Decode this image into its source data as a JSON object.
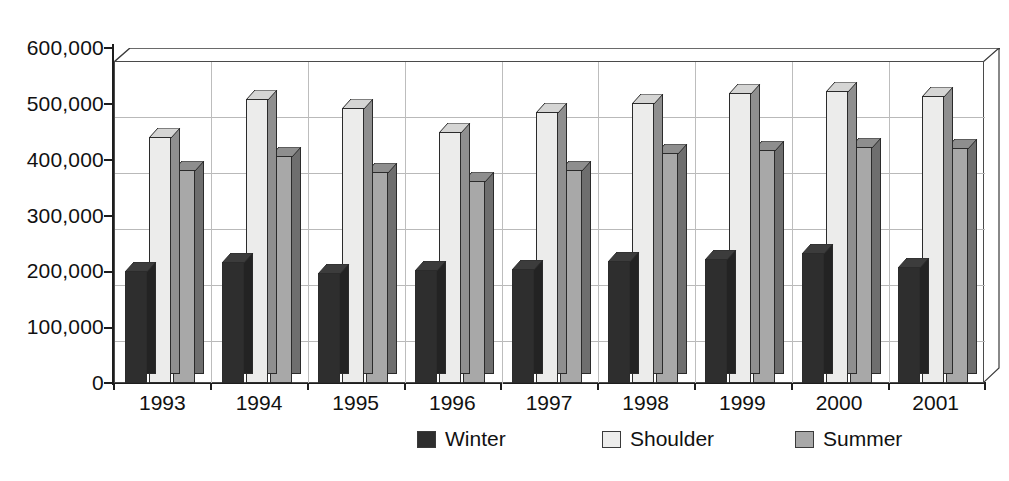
{
  "chart_data": {
    "type": "bar",
    "title": "",
    "xlabel": "",
    "ylabel": "",
    "categories": [
      "1993",
      "1994",
      "1995",
      "1996",
      "1997",
      "1998",
      "1999",
      "2000",
      "2001"
    ],
    "series": [
      {
        "name": "Winter",
        "color": "#2e2e2e",
        "values": [
          208000,
          226000,
          205000,
          211000,
          213000,
          228000,
          231000,
          242000,
          217000
        ]
      },
      {
        "name": "Shoulder",
        "color": "#ededec",
        "values": [
          458000,
          530000,
          512000,
          468000,
          505000,
          521000,
          541000,
          545000,
          535000
        ]
      },
      {
        "name": "Summer",
        "color": "#a8a8a8",
        "values": [
          396000,
          423000,
          394000,
          377000,
          396000,
          428000,
          434000,
          440000,
          437000
        ]
      }
    ],
    "ylim": [
      0,
      600000
    ],
    "ytick_values": [
      0,
      100000,
      200000,
      300000,
      400000,
      500000,
      600000
    ],
    "ytick_labels": [
      "0",
      "100,000",
      "200,000",
      "300,000",
      "400,000",
      "500,000",
      "600,000"
    ],
    "grid": true,
    "grid_axis": "y",
    "legend_position": "bottom",
    "three_d": true
  },
  "legend": {
    "items": [
      {
        "label": "Winter",
        "swatch": "winter"
      },
      {
        "label": "Shoulder",
        "swatch": "shoulder"
      },
      {
        "label": "Summer",
        "swatch": "summer"
      }
    ]
  }
}
